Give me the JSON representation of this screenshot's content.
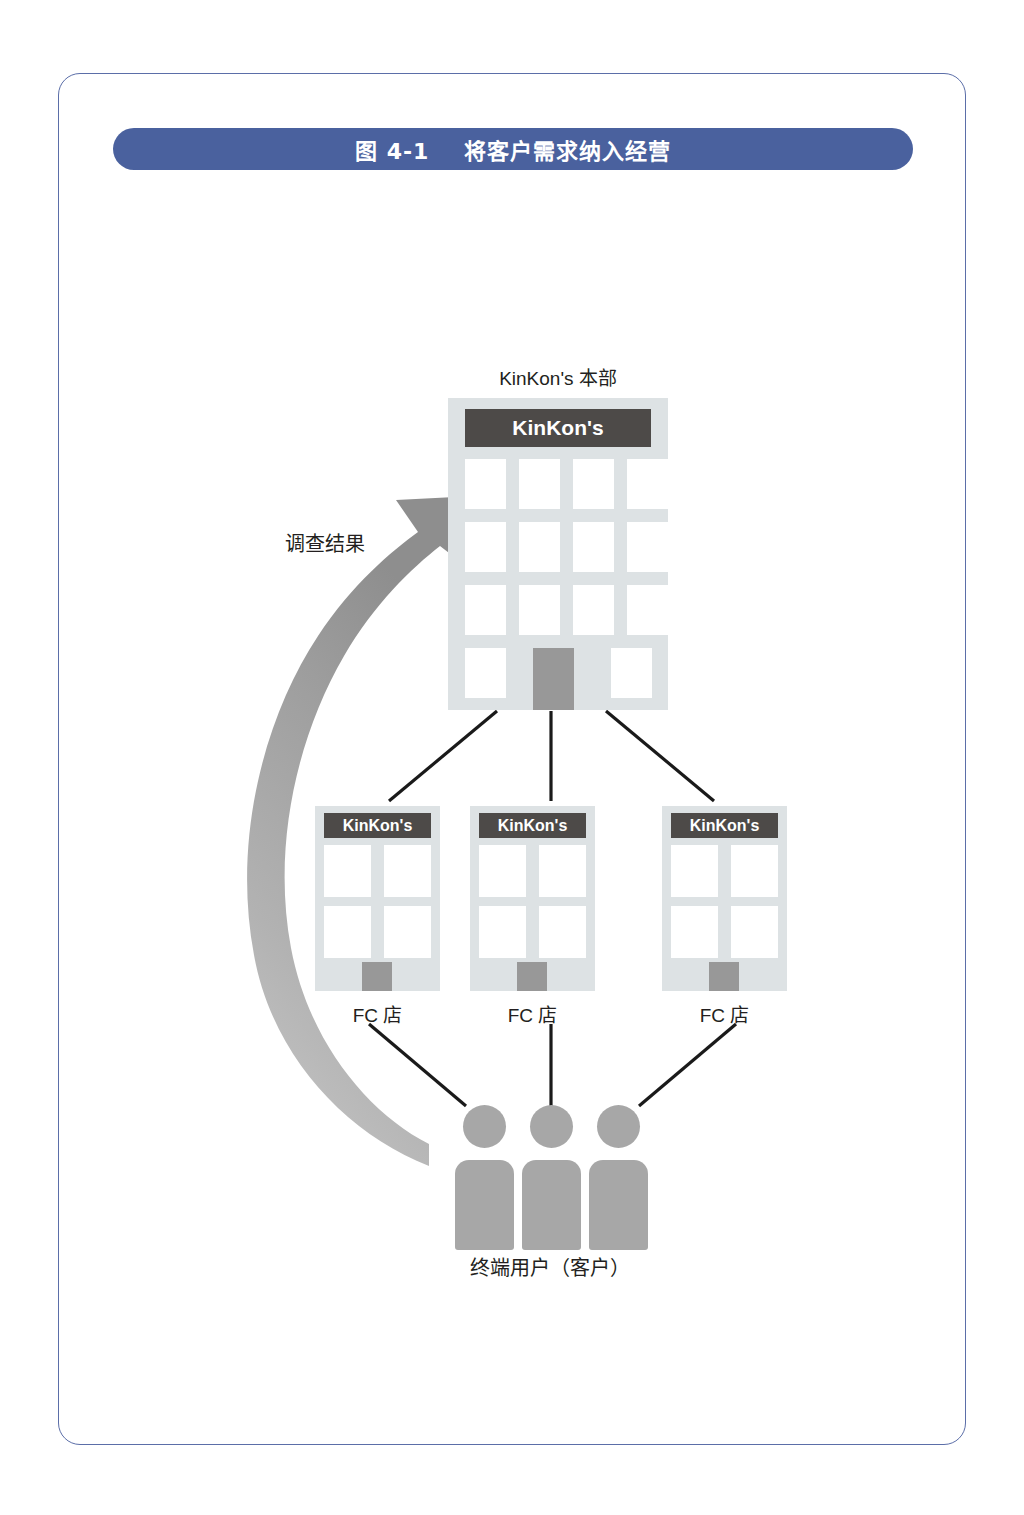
{
  "figure": {
    "title": "图 4-1    将客户需求纳入经营",
    "title_bar_color": "#4a619e",
    "frame_border_color": "#5b6ea8"
  },
  "diagram": {
    "headquarters": {
      "label": "KinKon's 本部",
      "sign_text": "KinKon's",
      "sign_color": "#4d4a48",
      "body_color": "#dde2e4",
      "door_color": "#989898",
      "window_count": 14
    },
    "stores": [
      {
        "label": "FC 店",
        "sign_text": "KinKon's"
      },
      {
        "label": "FC 店",
        "sign_text": "KinKon's"
      },
      {
        "label": "FC 店",
        "sign_text": "KinKon's"
      }
    ],
    "customers": {
      "label": "终端用户（客户）",
      "icon_name": "person-icon",
      "count": 3,
      "color": "#a7a7a7"
    },
    "feedback_arrow": {
      "label": "调查结果",
      "color": "#9a9a9a",
      "from": "终端用户（客户）",
      "to": "KinKon's 本部"
    }
  }
}
